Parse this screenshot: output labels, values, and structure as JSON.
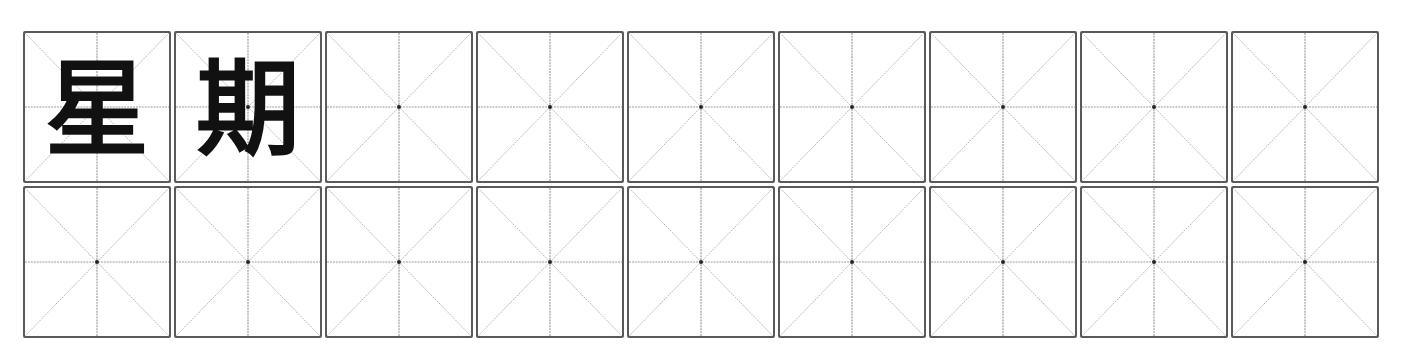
{
  "sheet": {
    "type": "mi-zi-ge practice grid",
    "rows": 2,
    "columns": 9,
    "colors": {
      "border": "#5a5a5a",
      "guide_line": "#b8b8b8",
      "guide_cross": "#9a9a9a",
      "center_dot": "#222222",
      "text": "#111111"
    },
    "cells": [
      [
        {
          "char": "星"
        },
        {
          "char": "期"
        },
        {
          "char": ""
        },
        {
          "char": ""
        },
        {
          "char": ""
        },
        {
          "char": ""
        },
        {
          "char": ""
        },
        {
          "char": ""
        },
        {
          "char": ""
        }
      ],
      [
        {
          "char": ""
        },
        {
          "char": ""
        },
        {
          "char": ""
        },
        {
          "char": ""
        },
        {
          "char": ""
        },
        {
          "char": ""
        },
        {
          "char": ""
        },
        {
          "char": ""
        },
        {
          "char": ""
        }
      ]
    ]
  }
}
